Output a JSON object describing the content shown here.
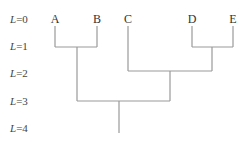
{
  "diagram": {
    "type": "dendrogram",
    "levels": [
      {
        "var": "L",
        "eq": "=0",
        "y": 19
      },
      {
        "var": "L",
        "eq": "=1",
        "y": 46
      },
      {
        "var": "L",
        "eq": "=2",
        "y": 73
      },
      {
        "var": "L",
        "eq": "=3",
        "y": 101
      },
      {
        "var": "L",
        "eq": "=4",
        "y": 128
      }
    ],
    "leaves": [
      {
        "label": "A",
        "x": 55
      },
      {
        "label": "B",
        "x": 97
      },
      {
        "label": "C",
        "x": 128
      },
      {
        "label": "D",
        "x": 192
      },
      {
        "label": "E",
        "x": 233
      }
    ],
    "merges": [
      {
        "children": [
          "A",
          "B"
        ],
        "level": 1
      },
      {
        "children": [
          "D",
          "E"
        ],
        "level": 1
      },
      {
        "children": [
          "C",
          "DE"
        ],
        "level": 2
      },
      {
        "children": [
          "AB",
          "CDE"
        ],
        "level": 3
      }
    ],
    "line_color": "#999999"
  }
}
